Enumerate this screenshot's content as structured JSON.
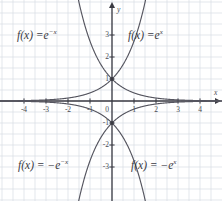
{
  "figure": {
    "title": "",
    "axis_x_name": "x",
    "axis_y_name": "y",
    "background_color": "#ffffff",
    "grid_color": "#d7dce4",
    "curve_color": "#55555f",
    "axis_color": "#3a3a42",
    "text_color": "#3a3a42"
  },
  "labels": {
    "top_left": {
      "lhs": "f(x) =",
      "base": "e",
      "exp": "−x",
      "full": "f(x) = e^(-x)"
    },
    "top_right": {
      "lhs": "f(x) =",
      "base": "e",
      "exp": "x",
      "full": "f(x) = e^x"
    },
    "bottom_left": {
      "lhs": "f(x) = −",
      "base": "e",
      "exp": "−x",
      "full": "f(x) = -e^(-x)"
    },
    "bottom_right": {
      "lhs": "f(x) = −",
      "base": "e",
      "exp": "x",
      "full": "f(x) = -e^x"
    }
  },
  "axes": {
    "x_ticks": [
      {
        "value": -4,
        "label": "-4"
      },
      {
        "value": -3,
        "label": "-3"
      },
      {
        "value": -2,
        "label": "-2"
      },
      {
        "value": -1,
        "label": "-1"
      },
      {
        "value": 1,
        "label": "1"
      },
      {
        "value": 2,
        "label": "2"
      },
      {
        "value": 3,
        "label": "3"
      },
      {
        "value": 4,
        "label": "4"
      }
    ],
    "y_ticks": [
      {
        "value": 3,
        "label": "3"
      },
      {
        "value": 2,
        "label": "2"
      },
      {
        "value": 1,
        "label": "1"
      },
      {
        "value": -1,
        "label": "-1"
      },
      {
        "value": -2,
        "label": "-2"
      },
      {
        "value": -3,
        "label": "-3"
      }
    ],
    "origin_label": "0"
  },
  "chart_data": {
    "type": "line",
    "title": "",
    "xlabel": "x",
    "ylabel": "y",
    "xlim": [
      -5.1,
      5.0
    ],
    "ylim": [
      -4.6,
      4.6
    ],
    "grid": true,
    "grid_step": 0.5,
    "legend": "inline-annotations",
    "markers": [
      {
        "x": 0,
        "y": 1,
        "label": "(0, 1)"
      },
      {
        "x": 0,
        "y": -1,
        "label": "(0, -1)"
      }
    ],
    "series": [
      {
        "name": "f(x) = e^x",
        "formula": "exp(x)",
        "annotation": "f(x) = e^x",
        "annotation_position": "top-right",
        "x": [
          -5,
          -4.5,
          -4,
          -3.5,
          -3,
          -2.5,
          -2,
          -1.5,
          -1,
          -0.5,
          0,
          0.5,
          1,
          1.5
        ],
        "y": [
          0.0067,
          0.0111,
          0.0183,
          0.0302,
          0.0498,
          0.0821,
          0.1353,
          0.2231,
          0.3679,
          0.6065,
          1,
          1.6487,
          2.7183,
          4.4817
        ]
      },
      {
        "name": "f(x) = e^-x",
        "formula": "exp(-x)",
        "annotation": "f(x) = e^(-x)",
        "annotation_position": "top-left",
        "x": [
          -1.5,
          -1,
          -0.5,
          0,
          0.5,
          1,
          1.5,
          2,
          2.5,
          3,
          3.5,
          4,
          4.5,
          5
        ],
        "y": [
          4.4817,
          2.7183,
          1.6487,
          1,
          0.6065,
          0.3679,
          0.2231,
          0.1353,
          0.0821,
          0.0498,
          0.0302,
          0.0183,
          0.0111,
          0.0067
        ]
      },
      {
        "name": "f(x) = -e^x",
        "formula": "-exp(x)",
        "annotation": "f(x) = -e^x",
        "annotation_position": "bottom-right",
        "x": [
          -5,
          -4.5,
          -4,
          -3.5,
          -3,
          -2.5,
          -2,
          -1.5,
          -1,
          -0.5,
          0,
          0.5,
          1,
          1.5
        ],
        "y": [
          -0.0067,
          -0.0111,
          -0.0183,
          -0.0302,
          -0.0498,
          -0.0821,
          -0.1353,
          -0.2231,
          -0.3679,
          -0.6065,
          -1,
          -1.6487,
          -2.7183,
          -4.4817
        ]
      },
      {
        "name": "f(x) = -e^-x",
        "formula": "-exp(-x)",
        "annotation": "f(x) = -e^(-x)",
        "annotation_position": "bottom-left",
        "x": [
          -1.5,
          -1,
          -0.5,
          0,
          0.5,
          1,
          1.5,
          2,
          2.5,
          3,
          3.5,
          4,
          4.5,
          5
        ],
        "y": [
          -4.4817,
          -2.7183,
          -1.6487,
          -1,
          -0.6065,
          -0.3679,
          -0.2231,
          -0.1353,
          -0.0821,
          -0.0498,
          -0.0302,
          -0.0183,
          -0.0111,
          -0.0067
        ]
      }
    ]
  }
}
